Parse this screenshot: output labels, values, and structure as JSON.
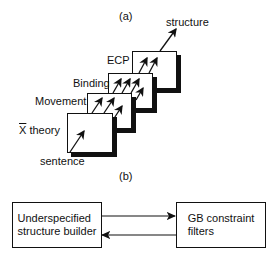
{
  "panel_a": {
    "label": "(a)",
    "output_label": "structure",
    "input_label": "sentence",
    "layers": [
      {
        "name": "ECP"
      },
      {
        "name": "Binding"
      },
      {
        "name": "Movement"
      },
      {
        "name": "X theory",
        "overbar": "X",
        "suffix": " theory"
      }
    ]
  },
  "panel_b": {
    "label": "(b)",
    "left_box": {
      "line1": "Underspecified",
      "line2": "structure builder"
    },
    "right_box": {
      "line1": "GB constraint",
      "line2": "filters"
    }
  }
}
